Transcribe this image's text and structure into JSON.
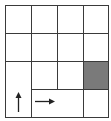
{
  "diagram": {
    "type": "grid-world",
    "rows": 4,
    "cols": 4,
    "colors": {
      "line": "#3a3a3a",
      "shaded": "#7a7a7a",
      "background": "#ffffff",
      "arrow": "#222222"
    },
    "cells": [
      {
        "id": "r0c0",
        "x": 5,
        "y": 5,
        "w": 26,
        "h": 28,
        "shaded": false
      },
      {
        "id": "r0c1",
        "x": 31,
        "y": 5,
        "w": 26,
        "h": 28,
        "shaded": false
      },
      {
        "id": "r0c2",
        "x": 57,
        "y": 5,
        "w": 26,
        "h": 28,
        "shaded": false
      },
      {
        "id": "r0c3",
        "x": 83,
        "y": 5,
        "w": 25,
        "h": 28,
        "shaded": false
      },
      {
        "id": "r1c0",
        "x": 5,
        "y": 33,
        "w": 26,
        "h": 28,
        "shaded": false
      },
      {
        "id": "r1c1",
        "x": 31,
        "y": 33,
        "w": 26,
        "h": 28,
        "shaded": false
      },
      {
        "id": "r1c2",
        "x": 57,
        "y": 33,
        "w": 26,
        "h": 28,
        "shaded": false
      },
      {
        "id": "r1c3",
        "x": 83,
        "y": 33,
        "w": 25,
        "h": 28,
        "shaded": false
      },
      {
        "id": "r2-3c0",
        "x": 5,
        "y": 61,
        "w": 26,
        "h": 56,
        "shaded": false,
        "arrow": "up"
      },
      {
        "id": "r2c1",
        "x": 31,
        "y": 61,
        "w": 26,
        "h": 28,
        "shaded": false
      },
      {
        "id": "r2c2",
        "x": 57,
        "y": 61,
        "w": 26,
        "h": 28,
        "shaded": false
      },
      {
        "id": "r2c3",
        "x": 83,
        "y": 61,
        "w": 25,
        "h": 28,
        "shaded": true
      },
      {
        "id": "r3c1-2",
        "x": 31,
        "y": 89,
        "w": 52,
        "h": 28,
        "shaded": false,
        "arrow": "right"
      },
      {
        "id": "r3c3",
        "x": 83,
        "y": 89,
        "w": 25,
        "h": 28,
        "shaded": false
      }
    ],
    "arrows": [
      {
        "direction": "up",
        "icon": "arrow-up-icon"
      },
      {
        "direction": "right",
        "icon": "arrow-right-icon"
      }
    ]
  }
}
